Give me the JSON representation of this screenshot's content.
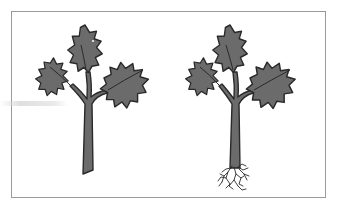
{
  "figure": {
    "panels": [
      {
        "id": "cutting-without-roots",
        "subject": "holly cutting",
        "roots": false,
        "leaves": 3
      },
      {
        "id": "cutting-with-roots",
        "subject": "holly cutting",
        "roots": true,
        "leaves": 3
      }
    ],
    "colors": {
      "leaf_fill": "#6b6b6b",
      "outline": "#2a2a2a",
      "frame": "#9a9a9a",
      "background": "#ffffff"
    }
  }
}
